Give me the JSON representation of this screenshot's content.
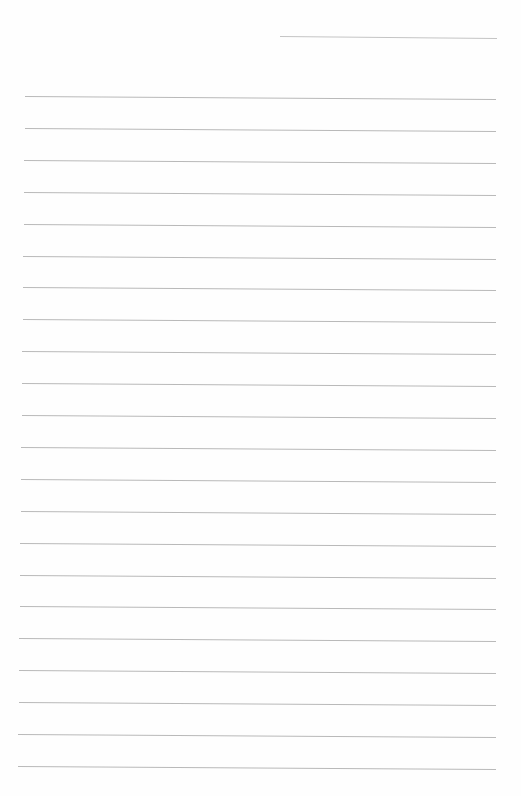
{
  "page": {
    "type": "lined-paper",
    "background": "#fefefe",
    "line_color": "#b9b9b9"
  },
  "header_line": {
    "x1": 280,
    "y1": 36,
    "x2": 497,
    "y2": 38
  },
  "ruled_lines": {
    "count": 22,
    "first_y": 96,
    "spacing": 31.9,
    "left_x_top": 25,
    "left_x_bottom": 18,
    "right_x": 496,
    "slope_px": 3
  }
}
